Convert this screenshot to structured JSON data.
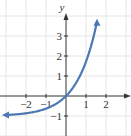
{
  "chart_data": {
    "type": "line",
    "title": "",
    "function": "y = e^x - 1",
    "xlabel": "x",
    "ylabel": "y",
    "xlim": [
      -3.3,
      3.0
    ],
    "ylim": [
      -2.0,
      4.8
    ],
    "grid": true,
    "x_ticks": [
      -2,
      -1,
      1,
      2
    ],
    "y_ticks": [
      -1,
      1,
      2,
      3
    ],
    "x_tick_labels": [
      "−2",
      "−1",
      "1",
      "2"
    ],
    "y_tick_labels": [
      "−1",
      "1",
      "2",
      "3"
    ],
    "series": [
      {
        "name": "curve",
        "color": "#4b79b3",
        "x": [
          -3.0,
          -2.5,
          -2.0,
          -1.5,
          -1.0,
          -0.5,
          0.0,
          0.5,
          1.0,
          1.25,
          1.5
        ],
        "y": [
          -0.95,
          -0.92,
          -0.86,
          -0.78,
          -0.63,
          -0.39,
          0.0,
          0.65,
          1.72,
          2.49,
          3.48
        ],
        "arrows": "both ends"
      }
    ],
    "asymptote": {
      "y": -1
    },
    "intercept": [
      0,
      0
    ]
  },
  "colors": {
    "curve": "#4b79b3",
    "grid": "#e6e6e6",
    "axis": "#333333"
  }
}
